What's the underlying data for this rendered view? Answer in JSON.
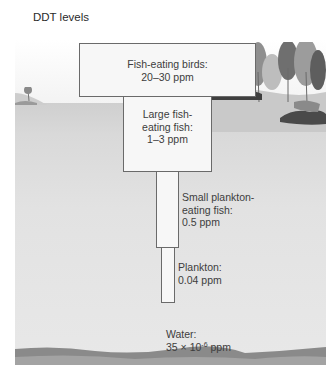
{
  "title": "DDT levels",
  "levels": [
    {
      "name": "Fish-eating birds:",
      "value": "20–30 ppm",
      "lines": [
        "Fish-eating birds:",
        "20–30 ppm"
      ]
    },
    {
      "name": "Large fish-eating fish:",
      "value": "1–3 ppm",
      "lines": [
        "Large fish-",
        "eating fish:",
        "1–3 ppm"
      ]
    },
    {
      "name": "Small plankton-eating fish:",
      "value": "0.5 ppm",
      "lines": [
        "Small plankton-",
        "eating fish:",
        "0.5 ppm"
      ]
    },
    {
      "name": "Plankton:",
      "value": "0.04 ppm",
      "lines": [
        "Plankton:",
        "0.04 ppm"
      ]
    },
    {
      "name": "Water:",
      "value": "35 × 10-6 ppm",
      "lines": [
        "Water:"
      ],
      "value_base": "35 × 10",
      "value_exp": "-6",
      "value_unit": " ppm"
    }
  ],
  "colors": {
    "box_fill": "#f7f7f7",
    "box_border": "#6a6a6a",
    "water": "#e2e2e2",
    "text": "#3d3d3d"
  }
}
